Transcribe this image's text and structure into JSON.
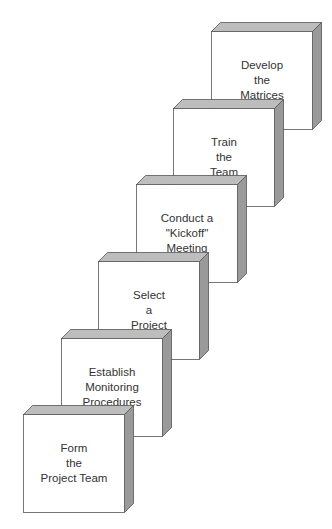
{
  "diagram": {
    "type": "staircase of 3D blocks",
    "colors": {
      "front": "#ffffff",
      "top": "#bdbdbd",
      "side": "#9a9a9a",
      "outline": "#555555",
      "text": "#333333"
    },
    "steps": [
      {
        "id": 1,
        "lines": [
          "Form",
          "the",
          "Project Team"
        ],
        "x": 23,
        "y": 405
      },
      {
        "id": 2,
        "lines": [
          "Establish",
          "Monitoring",
          "Procedures"
        ],
        "x": 61,
        "y": 329
      },
      {
        "id": 3,
        "lines": [
          "Select",
          "a",
          "Project"
        ],
        "x": 98,
        "y": 252
      },
      {
        "id": 4,
        "lines": [
          "Conduct a",
          "\"Kickoff\"",
          "Meeting"
        ],
        "x": 136,
        "y": 175
      },
      {
        "id": 5,
        "lines": [
          "Train",
          "the",
          "Team"
        ],
        "x": 173,
        "y": 99
      },
      {
        "id": 6,
        "lines": [
          "Develop",
          "the",
          "Matrices"
        ],
        "x": 211,
        "y": 22
      }
    ]
  }
}
